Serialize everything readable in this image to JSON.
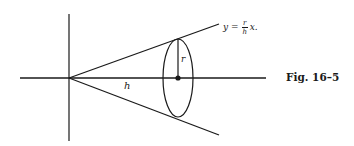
{
  "figure": {
    "caption": "Fig. 16–5",
    "equation": {
      "lhs": "y",
      "eq": "=",
      "numerator": "r",
      "denominator": "h",
      "rhs": "x."
    },
    "labels": {
      "height": "h",
      "radius": "r"
    },
    "colors": {
      "ink": "#1a1a1a",
      "background": "#ffffff"
    }
  }
}
